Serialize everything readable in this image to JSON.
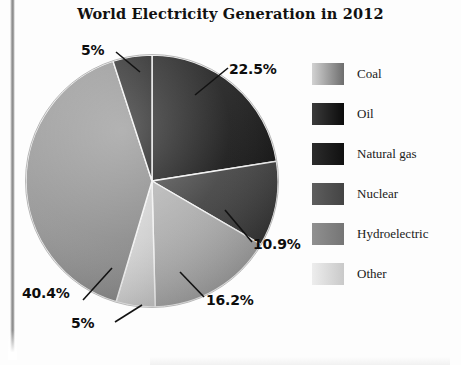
{
  "chart_data": {
    "type": "pie",
    "title": "World Electricity Generation in 2012",
    "categories": [
      "Coal",
      "Oil",
      "Natural gas",
      "Nuclear",
      "Hydroelectric",
      "Other"
    ],
    "values": [
      40.4,
      22.5,
      10.9,
      16.2,
      5,
      5
    ],
    "value_labels": [
      "40.4%",
      "22.5%",
      "10.9%",
      "16.2%",
      "5%",
      "5%"
    ],
    "unit": "%",
    "legend_position": "right",
    "grid": false,
    "xlabel": "",
    "ylabel": "",
    "slices": [
      {
        "label": "Oil",
        "value": 22.5,
        "display": "22.5%",
        "color": "#0d0d0d",
        "color_light": "#2b2b2b",
        "start_angle": 0,
        "end_angle": 81
      },
      {
        "label": "Natural gas",
        "value": 10.9,
        "display": "10.9%",
        "color": "#2f2f2f",
        "color_light": "#4d4d4d",
        "start_angle": 81,
        "end_angle": 120.2
      },
      {
        "label": "Nuclear",
        "value": 16.2,
        "display": "16.2%",
        "color": "#9b9b9b",
        "color_light": "#b4b4b4",
        "start_angle": 120.2,
        "end_angle": 178.5
      },
      {
        "label": "Hydroelectric",
        "value": 5,
        "display": "5%",
        "color": "#c6c6c6",
        "color_light": "#dedede",
        "start_angle": 178.5,
        "end_angle": 196.5
      },
      {
        "label": "Coal",
        "value": 40.4,
        "display": "40.4%",
        "color": "#858585",
        "color_light": "#a2a2a2",
        "start_angle": 196.5,
        "end_angle": 341.9
      },
      {
        "label": "Other",
        "value": 5,
        "display": "5%",
        "color": "#171717",
        "color_light": "#343434",
        "start_angle": 341.9,
        "end_angle": 360
      }
    ]
  },
  "title": "World Electricity Generation in 2012",
  "callouts": {
    "oil": "22.5%",
    "natural_gas": "10.9%",
    "nuclear": "16.2%",
    "hydroelectric": "5%",
    "coal": "40.4%",
    "other": "5%"
  },
  "legend": {
    "items": [
      {
        "label": "Coal",
        "swatch_from": "#d2d2d2",
        "swatch_to": "#6d6d6d"
      },
      {
        "label": "Oil",
        "swatch_from": "#3b3b3b",
        "swatch_to": "#0b0b0b"
      },
      {
        "label": "Natural gas",
        "swatch_from": "#2c2c2c",
        "swatch_to": "#101010"
      },
      {
        "label": "Nuclear",
        "swatch_from": "#5e5e5e",
        "swatch_to": "#444444"
      },
      {
        "label": "Hydroelectric",
        "swatch_from": "#909090",
        "swatch_to": "#757575"
      },
      {
        "label": "Other",
        "swatch_from": "#ededed",
        "swatch_to": "#c9c9c9"
      }
    ]
  }
}
